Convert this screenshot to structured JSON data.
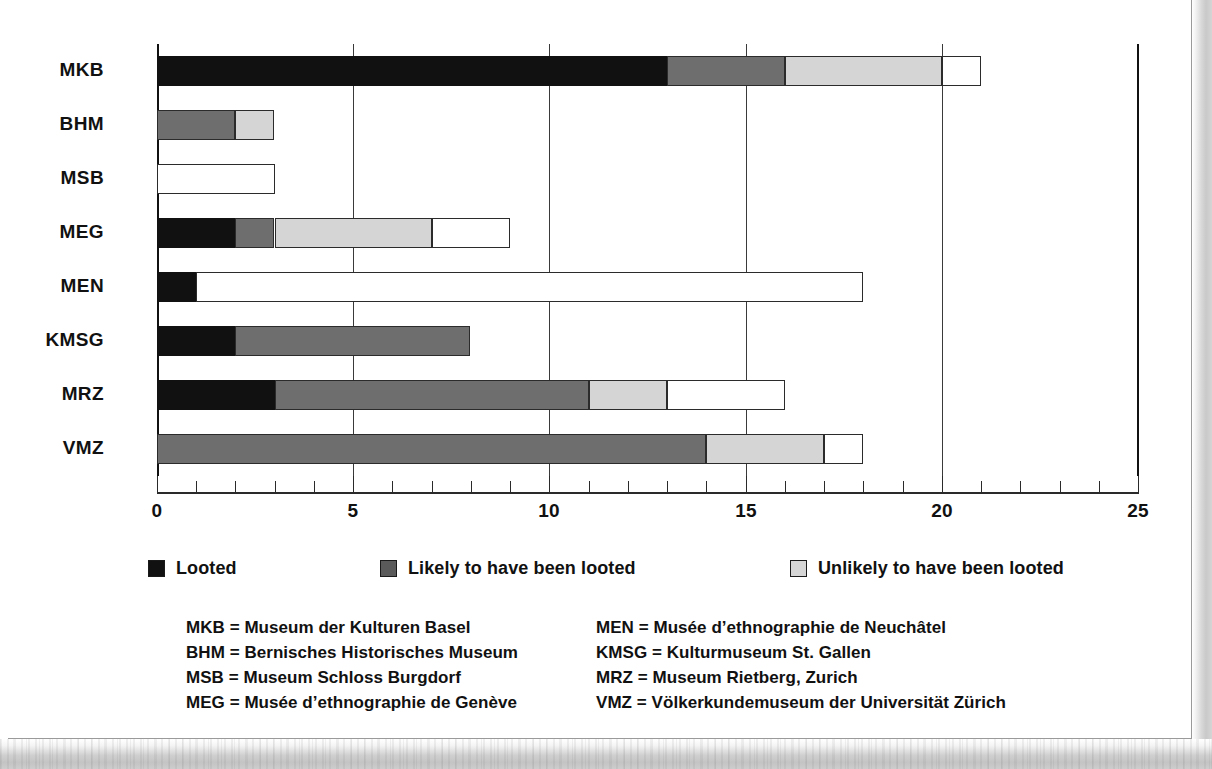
{
  "chart_data": {
    "type": "bar",
    "orientation": "horizontal",
    "stacked": true,
    "title": "",
    "xlabel": "",
    "ylabel": "",
    "xlim": [
      0,
      25
    ],
    "xticks": [
      0,
      5,
      10,
      15,
      20,
      25
    ],
    "xtick_labels": [
      "0",
      "5",
      "10",
      "15",
      "20",
      "25"
    ],
    "minor_tick_step": 1,
    "grid": "vertical-major",
    "legend_position": "below-axis",
    "categories": [
      "MKB",
      "BHM",
      "MSB",
      "MEG",
      "MEN",
      "KMSG",
      "MRZ",
      "VMZ"
    ],
    "series": [
      {
        "name": "Looted",
        "color": "#111111",
        "values": [
          13,
          0,
          0,
          2,
          1,
          2,
          3,
          0
        ]
      },
      {
        "name": "Likely to have been looted",
        "color": "#6e6e6e",
        "values": [
          3,
          2,
          0,
          1,
          0,
          6,
          8,
          14
        ]
      },
      {
        "name": "Unlikely to have been looted",
        "color": "#d5d5d5",
        "values": [
          4,
          1,
          0,
          4,
          0,
          0,
          2,
          3
        ]
      },
      {
        "name": "Not looted",
        "color": "#ffffff",
        "values": [
          1,
          0,
          3,
          2,
          17,
          0,
          3,
          1
        ]
      }
    ],
    "totals": [
      21,
      3,
      3,
      9,
      18,
      8,
      16,
      18
    ]
  },
  "legend": {
    "items": [
      {
        "label": "Looted",
        "swatch": "c0"
      },
      {
        "label": "Likely to have been looted",
        "swatch": "c1"
      },
      {
        "label": "Unlikely to have been looted",
        "swatch": "c2"
      },
      {
        "label": "Not looted",
        "swatch": "c3"
      }
    ]
  },
  "key": {
    "left": [
      "MKB = Museum der Kulturen Basel",
      "BHM = Bernisches Historisches Museum",
      "MSB = Museum Schloss Burgdorf",
      "MEG = Musée d’ethnographie de Genève"
    ],
    "right": [
      "MEN = Musée d’ethnographie de Neuchâtel",
      "KMSG = Kulturmuseum St. Gallen",
      "MRZ = Museum Rietberg, Zurich",
      "VMZ = Völkerkundemuseum der Universität Zürich"
    ]
  },
  "colors": {
    "looted": "#111111",
    "likely": "#6e6e6e",
    "unlikely": "#d5d5d5",
    "not_looted": "#ffffff",
    "axis": "#111111",
    "grid": "#3a3a3a"
  }
}
